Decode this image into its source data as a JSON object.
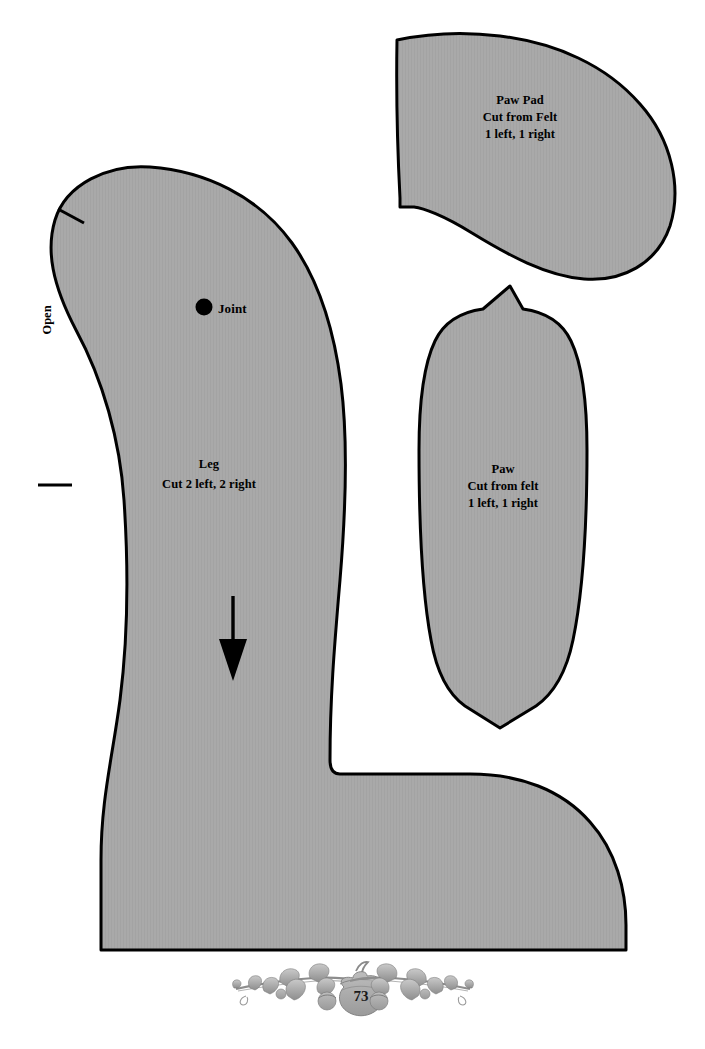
{
  "page": {
    "number": "73",
    "background_color": "#ffffff",
    "piece_fill_color": "#a8a8a8",
    "outline_color": "#000000"
  },
  "pieces": [
    {
      "id": "leg",
      "name": "Leg",
      "label_lines": [
        "Leg",
        "Cut 2 left, 2 right"
      ],
      "markings": {
        "joint_label": "Joint",
        "open_label": "Open",
        "grain_arrow": "down-arrow",
        "tick_marks": 2
      }
    },
    {
      "id": "paw-pad",
      "name": "Paw Pad",
      "label_lines": [
        "Paw Pad",
        "Cut from Felt",
        "1 left, 1 right"
      ]
    },
    {
      "id": "paw",
      "name": "Paw",
      "label_lines": [
        "Paw",
        "Cut from felt",
        "1 left, 1 right"
      ]
    }
  ],
  "footer": {
    "page_number": "73",
    "ornament": "oak-branch-acorn-ornament"
  }
}
